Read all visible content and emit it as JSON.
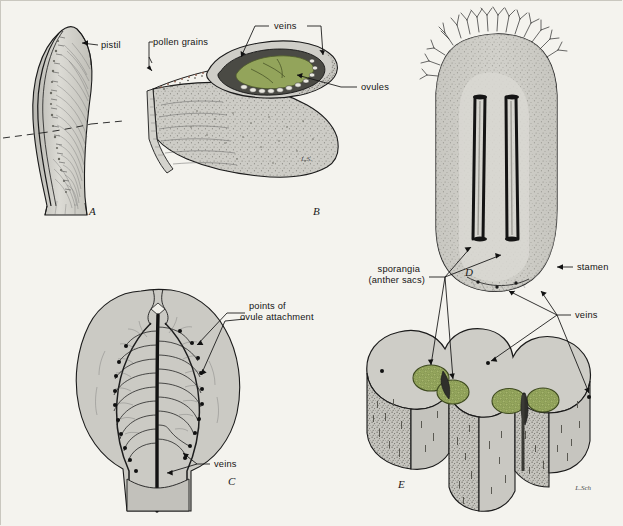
{
  "figure": {
    "background_color": "#f4f3ee",
    "ink_color": "#1b1b1b",
    "tissue_fill": "#c9c8c2",
    "green_fill": "#8d9e55",
    "green_dark": "#5f6e33"
  },
  "panels": [
    {
      "id": "A",
      "letter": "A",
      "name": "pistil-exterior",
      "x": 88,
      "y": 214
    },
    {
      "id": "B",
      "letter": "B",
      "name": "pistil-cross-section",
      "x": 312,
      "y": 214
    },
    {
      "id": "C",
      "letter": "C",
      "name": "pistil-opened-inner-surface",
      "x": 227,
      "y": 484
    },
    {
      "id": "D",
      "letter": "D",
      "name": "stamen-face-view",
      "x": 464,
      "y": 275
    },
    {
      "id": "E",
      "letter": "E",
      "name": "stamen-cross-section",
      "x": 397,
      "y": 487
    }
  ],
  "labels": [
    {
      "id": "pistil",
      "text": "pistil",
      "name": "label-pistil",
      "x": 100,
      "y": 47,
      "anchor": "start"
    },
    {
      "id": "pollen",
      "text": "pollen grains",
      "name": "label-pollen-grains",
      "x": 152,
      "y": 44,
      "anchor": "start"
    },
    {
      "id": "veins_b",
      "text": "veins",
      "name": "label-veins-panel-b",
      "x": 273,
      "y": 28,
      "anchor": "start"
    },
    {
      "id": "ovules",
      "text": "ovules",
      "name": "label-ovules",
      "x": 360,
      "y": 89,
      "anchor": "start"
    },
    {
      "id": "points1",
      "text": "points of",
      "name": "label-points-of-ovule-attachment-line1",
      "x": 248,
      "y": 308,
      "anchor": "start"
    },
    {
      "id": "points2",
      "text": "ovule attachment",
      "name": "label-points-of-ovule-attachment-line2",
      "x": 239,
      "y": 319,
      "anchor": "start"
    },
    {
      "id": "veins_c",
      "text": "veins",
      "name": "label-veins-panel-c",
      "x": 213,
      "y": 466,
      "anchor": "start"
    },
    {
      "id": "spor1",
      "text": "sporangia",
      "name": "label-sporangia-line1",
      "x": 419,
      "y": 271,
      "anchor": "end"
    },
    {
      "id": "spor2",
      "text": "(anther sacs)",
      "name": "label-sporangia-line2",
      "x": 424,
      "y": 282,
      "anchor": "end"
    },
    {
      "id": "stamen",
      "text": "stamen",
      "name": "label-stamen",
      "x": 576,
      "y": 269,
      "anchor": "start"
    },
    {
      "id": "veins_e",
      "text": "veins",
      "name": "label-veins-panel-e",
      "x": 574,
      "y": 317,
      "anchor": "start"
    }
  ],
  "signature": {
    "text": "L.Sch",
    "name": "artist-signature",
    "x": 590,
    "y": 489
  }
}
